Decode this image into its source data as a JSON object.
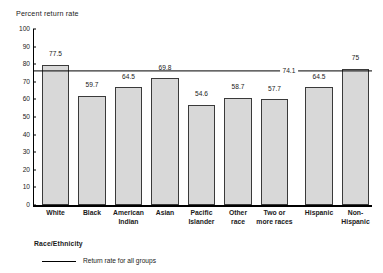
{
  "chart_data": {
    "type": "bar",
    "title": "",
    "xlabel": "Race/Ethnicity",
    "ylabel": "Percent return rate",
    "ylim": [
      0,
      100
    ],
    "ytick_step": 10,
    "yticks": [
      "100",
      "90",
      "80",
      "70",
      "60",
      "50",
      "40",
      "30",
      "20",
      "10",
      "0"
    ],
    "grid": false,
    "legend_position": "below-axis-left",
    "categories": [
      "White",
      "Black",
      "American\nIndian",
      "Asian",
      "Pacific\nIslander",
      "Other\nrace",
      "Two or\nmore races",
      "Hispanic",
      "Non-\nHispanic"
    ],
    "values": [
      77.5,
      59.7,
      64.5,
      69.8,
      54.6,
      58.7,
      57.7,
      64.5,
      75
    ],
    "value_labels": [
      "77.5",
      "59.7",
      "64.5",
      "69.8",
      "54.6",
      "58.7",
      "57.7",
      "64.5",
      "75"
    ],
    "reference_line": {
      "value": 74.1,
      "label": "74.1",
      "legend": "Return rate for all groups"
    },
    "bar_color": "#d8d8d8",
    "bar_edge_color": "#3a3a3a",
    "axis_color": "#000000"
  }
}
